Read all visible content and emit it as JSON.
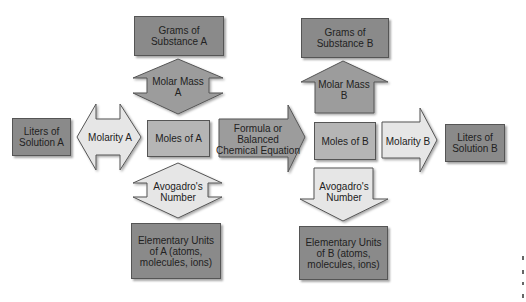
{
  "diagram": {
    "nodes": {
      "grams_a": "Grams of Substance A",
      "grams_b": "Grams of Substance B",
      "liters_a": "Liters of Solution A",
      "moles_a": "Moles of A",
      "moles_b": "Moles of B",
      "liters_b": "Liters of Solution B",
      "elem_a": "Elementary Units of A (atoms, molecules, ions)",
      "elem_b": "Elementary Units of B (atoms, molecules, ions)"
    },
    "connectors": {
      "molar_mass_a": "Molar Mass A",
      "molar_mass_b": "Molar Mass B",
      "molarity_a": "Molarity A",
      "molarity_b": "Molarity B",
      "formula": "Formula or Balanced Chemical Equation",
      "avogadro_a": "Avogadro's Number",
      "avogadro_b": "Avogadro's Number"
    },
    "colors": {
      "dark_box": "#8a8a8a",
      "mid_box": "#b5b5b5",
      "light_arrow": "#e6e6e6",
      "mid_arrow": "#9c9c9c"
    }
  }
}
